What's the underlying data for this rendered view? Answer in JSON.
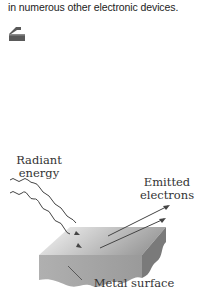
{
  "text": {
    "top_line": "in numerous other electronic devices."
  },
  "icon": {
    "name": "page-marker-icon",
    "color": "#5a5a5a"
  },
  "figure": {
    "labels": {
      "radiant_line1": "Radiant",
      "radiant_line2": "energy",
      "emitted_line1": "Emitted",
      "emitted_line2": "electrons",
      "metal": "Metal surface"
    },
    "colors": {
      "slab_top_light": "#f4f4f4",
      "slab_top_dark": "#9a9a9a",
      "slab_front": "#a8a8a8",
      "slab_side": "#7a7a7a",
      "arrows": "#444444"
    }
  }
}
